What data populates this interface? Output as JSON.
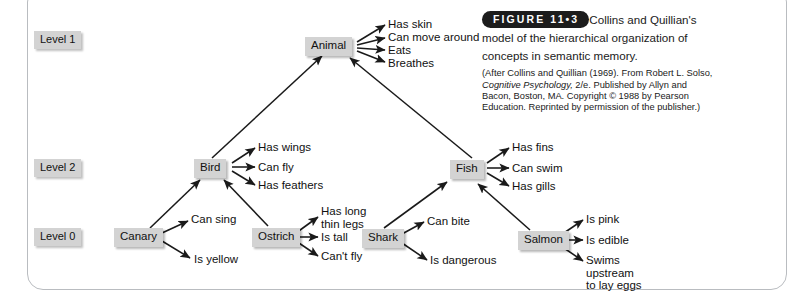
{
  "figure": {
    "badge": "FIGURE 11•3",
    "title": "Collins and Quillian's model of the hierarchical organization of concepts in semantic memory.",
    "source_line1": "(After Collins and Quillian (1969). From Robert L. Solso,",
    "source_italic": "Cognitive Psychology,",
    "source_line2_rest": " 2/e. Published by Allyn and Bacon,",
    "source_line3": "Boston, MA. Copyright © 1988 by Pearson Education.",
    "source_line4": "Reprinted by permission of the publisher.)"
  },
  "levels": [
    {
      "label": "Level 1"
    },
    {
      "label": "Level 2"
    },
    {
      "label": "Level 0"
    }
  ],
  "nodes": [
    {
      "id": "animal",
      "label": "Animal",
      "level": "Level 1"
    },
    {
      "id": "bird",
      "label": "Bird",
      "level": "Level 2"
    },
    {
      "id": "fish",
      "label": "Fish",
      "level": "Level 2"
    },
    {
      "id": "canary",
      "label": "Canary",
      "level": "Level 0"
    },
    {
      "id": "ostrich",
      "label": "Ostrich",
      "level": "Level 0"
    },
    {
      "id": "shark",
      "label": "Shark",
      "level": "Level 0"
    },
    {
      "id": "salmon",
      "label": "Salmon",
      "level": "Level 0"
    }
  ],
  "properties": {
    "animal": [
      "Has skin",
      "Can move around",
      "Eats",
      "Breathes"
    ],
    "bird": [
      "Has wings",
      "Can fly",
      "Has feathers"
    ],
    "fish": [
      "Has fins",
      "Can swim",
      "Has gills"
    ],
    "canary": [
      "Can sing",
      "Is yellow"
    ],
    "ostrich": [
      "Has long\nthin legs",
      "Is tall",
      "Can't fly"
    ],
    "shark": [
      "Can bite",
      "Is dangerous"
    ],
    "salmon": [
      "Is pink",
      "Is edible",
      "Swims\nupstream\nto lay eggs"
    ]
  },
  "isa_links": [
    {
      "from": "bird",
      "to": "animal"
    },
    {
      "from": "fish",
      "to": "animal"
    },
    {
      "from": "canary",
      "to": "bird"
    },
    {
      "from": "ostrich",
      "to": "bird"
    },
    {
      "from": "shark",
      "to": "fish"
    },
    {
      "from": "salmon",
      "to": "fish"
    }
  ],
  "colors": {
    "node_fill": "#d3d3d3",
    "text": "#111111",
    "edge": "#1a1a1a",
    "frame": "#b9bcc0",
    "badge_bg": "#1c1c1c"
  }
}
